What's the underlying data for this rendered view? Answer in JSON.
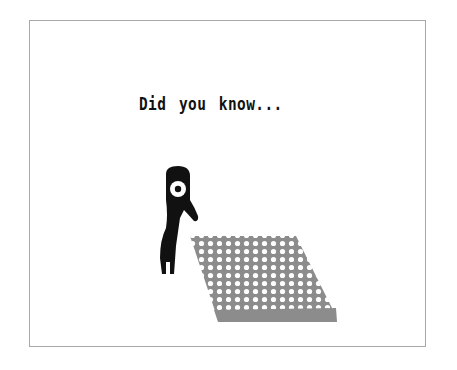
{
  "screen": {
    "tip_heading": "Did you know...",
    "colors": {
      "background": "#ffffff",
      "frame_border": "#a8a8a8",
      "creature": "#111111",
      "field": "#8c8c8c",
      "field_dots": "#ffffff"
    },
    "illustration": {
      "creature": "one-eyed-creature",
      "field": "dotted-grass-patch"
    }
  }
}
